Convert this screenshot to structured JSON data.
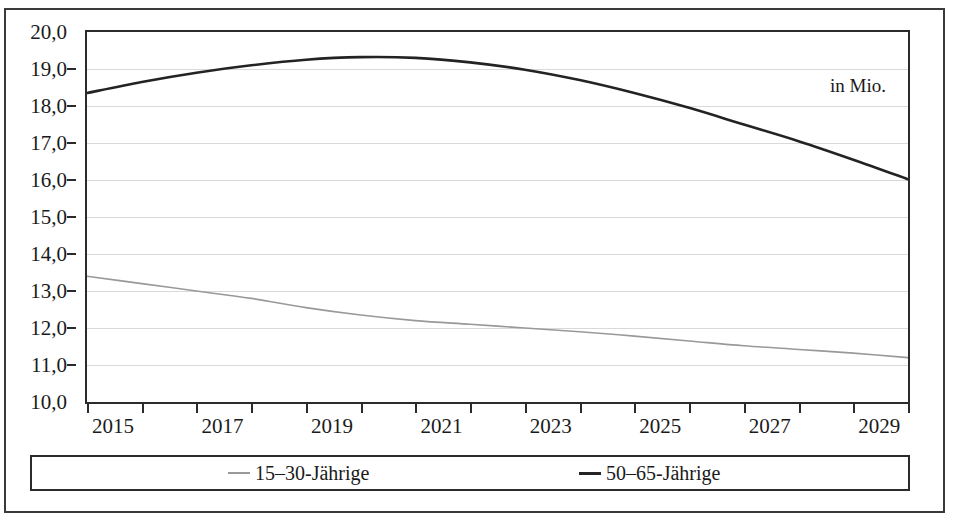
{
  "chart_data": {
    "type": "line",
    "title": "",
    "subtitle": "",
    "xlabel": "",
    "ylabel": "",
    "unit_annotation": "in Mio.",
    "grid": true,
    "legend_position": "bottom",
    "xlim": [
      2015,
      2030
    ],
    "ylim": [
      10.0,
      20.0
    ],
    "y_ticks": [
      20.0,
      19.0,
      18.0,
      17.0,
      16.0,
      15.0,
      14.0,
      13.0,
      12.0,
      11.0,
      10.0
    ],
    "y_tick_labels": [
      "20,0",
      "19,0",
      "18,0",
      "17,0",
      "16,0",
      "15,0",
      "14,0",
      "13,0",
      "12,0",
      "11,0",
      "10,0"
    ],
    "x_ticks": [
      2015,
      2016,
      2017,
      2018,
      2019,
      2020,
      2021,
      2022,
      2023,
      2024,
      2025,
      2026,
      2027,
      2028,
      2029,
      2030
    ],
    "x_tick_labels_shown": [
      "2015",
      "2017",
      "2019",
      "2021",
      "2023",
      "2025",
      "2027",
      "2029"
    ],
    "x": [
      2015,
      2016,
      2017,
      2018,
      2019,
      2020,
      2021,
      2022,
      2023,
      2024,
      2025,
      2026,
      2027,
      2028,
      2029,
      2030
    ],
    "series": [
      {
        "name": "15–30-Jährige",
        "color": "#999999",
        "width": 1.6,
        "values": [
          13.4,
          13.2,
          13.0,
          12.8,
          12.55,
          12.35,
          12.2,
          12.1,
          12.0,
          11.9,
          11.78,
          11.65,
          11.52,
          11.42,
          11.32,
          11.2
        ]
      },
      {
        "name": "50–65-Jährige",
        "color": "#232323",
        "width": 2.6,
        "values": [
          18.35,
          18.65,
          18.9,
          19.1,
          19.25,
          19.32,
          19.3,
          19.18,
          18.98,
          18.7,
          18.35,
          17.95,
          17.5,
          17.05,
          16.55,
          16.02
        ]
      }
    ]
  },
  "legend": {
    "entries": [
      {
        "label": "15–30-Jährige",
        "color": "#999999"
      },
      {
        "label": "50–65-Jährige",
        "color": "#232323"
      }
    ]
  },
  "annotations": {
    "unit": "in Mio."
  }
}
